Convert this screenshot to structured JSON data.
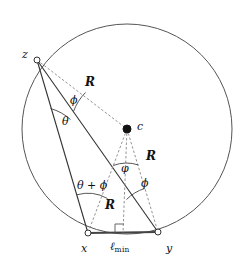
{
  "figure": {
    "type": "geometry-diagram",
    "background_color": "#ffffff",
    "stroke_color": "#444444",
    "dashed_color": "#777777",
    "text_color": "#111111",
    "circle": {
      "center_x": 127,
      "center_y": 129,
      "radius": 105,
      "label": "circle"
    },
    "points": [
      {
        "id": "z",
        "label": "z",
        "x": 37,
        "y": 60,
        "marker": "open",
        "label_x": 22,
        "label_y": 49
      },
      {
        "id": "c",
        "label": "c",
        "x": 127,
        "y": 129,
        "marker": "filled",
        "label_x": 137,
        "label_y": 121
      },
      {
        "id": "x",
        "label": "x",
        "x": 88,
        "y": 233,
        "marker": "open",
        "label_x": 81,
        "label_y": 243
      },
      {
        "id": "y",
        "label": "y",
        "x": 158,
        "y": 232,
        "marker": "open",
        "label_x": 166,
        "label_y": 243
      },
      {
        "id": "foot",
        "label": "",
        "x": 123,
        "y": 233,
        "marker": "none",
        "label_x": 0,
        "label_y": 0
      }
    ],
    "solid_edges": [
      {
        "from": "z",
        "to": "x",
        "name": "edge-z-x"
      },
      {
        "from": "z",
        "to": "y",
        "name": "edge-z-y"
      },
      {
        "from": "x",
        "to": "y",
        "name": "edge-x-y"
      }
    ],
    "dashed_edges": [
      {
        "from": "z",
        "to": "c",
        "name": "radius-z-c"
      },
      {
        "from": "c",
        "to": "x",
        "name": "radius-c-x"
      },
      {
        "from": "c",
        "to": "y",
        "name": "radius-c-y"
      },
      {
        "from": "c",
        "to": "foot",
        "name": "perpendicular-c-foot"
      }
    ],
    "radius_labels": [
      {
        "text": "R",
        "x": 85,
        "y": 76,
        "name": "radius-label-zc"
      },
      {
        "text": "R",
        "x": 146,
        "y": 150,
        "name": "radius-label-cy"
      },
      {
        "text": "R",
        "x": 105,
        "y": 199,
        "name": "radius-label-cx"
      }
    ],
    "angle_labels": [
      {
        "text": "ϕ",
        "x": 70,
        "y": 95,
        "name": "angle-phi-at-z"
      },
      {
        "text": "θ",
        "x": 62,
        "y": 116,
        "name": "angle-theta-at-z"
      },
      {
        "text": "φ",
        "x": 121,
        "y": 163,
        "name": "angle-varphi-at-c"
      },
      {
        "text": "ϕ",
        "x": 141,
        "y": 178,
        "name": "angle-phi-at-y"
      },
      {
        "text": "θ + ϕ",
        "x": 77,
        "y": 180,
        "name": "angle-theta-plus-phi-at-x"
      }
    ],
    "chord_label": {
      "base": "ℓ",
      "subscript": "min",
      "x": 110,
      "y": 241,
      "name": "chord-length-label"
    },
    "right_angle": {
      "x": 123,
      "y": 233,
      "size": 8,
      "name": "right-angle-marker"
    },
    "angle_arcs": [
      {
        "name": "arc-phi-at-z",
        "vertex": "z",
        "radius": 52
      },
      {
        "name": "arc-theta-at-z",
        "vertex": "z",
        "radius": 46
      },
      {
        "name": "arc-varphi-at-c",
        "vertex": "c",
        "radius": 38
      },
      {
        "name": "arc-phi-at-y",
        "vertex": "y",
        "radius": 46
      },
      {
        "name": "arc-theta-phi-at-x",
        "vertex": "x",
        "radius": 40
      }
    ]
  }
}
